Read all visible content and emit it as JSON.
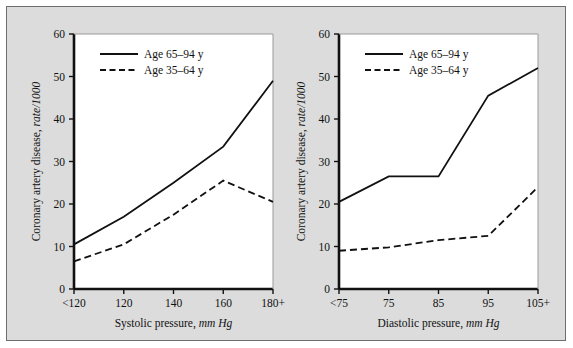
{
  "figure": {
    "background_color": "#dcdcdc",
    "plot_background_color": "#ffffff",
    "border_color": "#6e6e6e",
    "line_color": "#111111"
  },
  "legend": {
    "series_1_label": "Age 65–94 y",
    "series_2_label": "Age 35–64 y",
    "series_1_style": "solid",
    "series_2_style": "dashed",
    "position": "top-left inside axes"
  },
  "chart_data": [
    {
      "type": "line",
      "panel": "left",
      "title": "",
      "xlabel_plain": "Systolic pressure, ",
      "xlabel_italic": "mm Hg",
      "xlabel": "Systolic pressure, mm Hg",
      "ylabel_plain": "Coronary artery disease, ",
      "ylabel_italic": "rate/1000",
      "ylabel": "Coronary artery disease, rate/1000",
      "categories": [
        "<120",
        "120",
        "140",
        "160",
        "180+"
      ],
      "xticklabels": [
        "<120",
        "120",
        "140",
        "160",
        "180+"
      ],
      "yticklabels": [
        "0",
        "10",
        "20",
        "30",
        "40",
        "50",
        "60"
      ],
      "yticks": [
        0,
        10,
        20,
        30,
        40,
        50,
        60
      ],
      "ylim": [
        0,
        60
      ],
      "grid": false,
      "legend_position": "upper left",
      "series": [
        {
          "name": "Age 65–94 y",
          "style": "solid",
          "values": [
            10.5,
            17.0,
            25.0,
            33.5,
            49.0
          ]
        },
        {
          "name": "Age 35–64 y",
          "style": "dashed",
          "values": [
            6.5,
            10.5,
            17.5,
            25.5,
            20.5
          ]
        }
      ]
    },
    {
      "type": "line",
      "panel": "right",
      "title": "",
      "xlabel_plain": "Diastolic pressure, ",
      "xlabel_italic": "mm Hg",
      "xlabel": "Diastolic pressure, mm Hg",
      "ylabel_plain": "Coronary artery disease, ",
      "ylabel_italic": "rate/1000",
      "ylabel": "Coronary artery disease, rate/1000",
      "categories": [
        "<75",
        "75",
        "85",
        "95",
        "105+"
      ],
      "xticklabels": [
        "<75",
        "75",
        "85",
        "95",
        "105+"
      ],
      "yticklabels": [
        "0",
        "10",
        "20",
        "30",
        "40",
        "50",
        "60"
      ],
      "yticks": [
        0,
        10,
        20,
        30,
        40,
        50,
        60
      ],
      "ylim": [
        0,
        60
      ],
      "grid": false,
      "legend_position": "upper left",
      "series": [
        {
          "name": "Age 65–94 y",
          "style": "solid",
          "values": [
            20.5,
            26.5,
            26.5,
            45.5,
            52.0
          ]
        },
        {
          "name": "Age 35–64 y",
          "style": "dashed",
          "values": [
            9.0,
            9.8,
            11.5,
            12.5,
            24.0
          ]
        }
      ]
    }
  ]
}
